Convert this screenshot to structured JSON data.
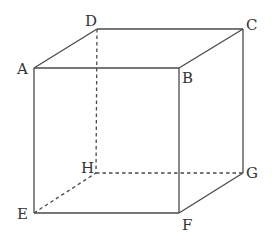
{
  "diagram": {
    "type": "cube",
    "vertices": {
      "A": {
        "label": "A",
        "x": 34,
        "y": 68,
        "lx": 17,
        "ly": 74
      },
      "B": {
        "label": "B",
        "x": 179,
        "y": 68,
        "lx": 182,
        "ly": 83
      },
      "C": {
        "label": "C",
        "x": 243,
        "y": 29,
        "lx": 246,
        "ly": 30
      },
      "D": {
        "label": "D",
        "x": 97,
        "y": 29,
        "lx": 85,
        "ly": 26
      },
      "E": {
        "label": "E",
        "x": 34,
        "y": 213,
        "lx": 17,
        "ly": 219
      },
      "F": {
        "label": "F",
        "x": 179,
        "y": 213,
        "lx": 182,
        "ly": 229
      },
      "G": {
        "label": "G",
        "x": 243,
        "y": 173,
        "lx": 246,
        "ly": 178
      },
      "H": {
        "label": "H",
        "x": 96,
        "y": 173,
        "lx": 81,
        "ly": 172
      }
    },
    "visible_edges": [
      "AB",
      "BC",
      "CD",
      "DA",
      "AE",
      "BF",
      "CG",
      "EF",
      "FG"
    ],
    "hidden_edges": [
      "DH",
      "EH",
      "HG"
    ]
  }
}
